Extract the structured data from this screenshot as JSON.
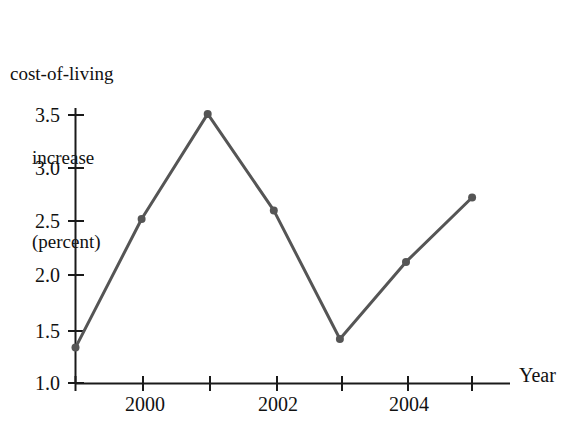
{
  "chart_data": {
    "type": "line",
    "title": "cost-of-living increase (percent)",
    "title_lines": [
      "cost-of-living",
      "increase",
      "(percent)"
    ],
    "xlabel": "Year",
    "ylabel": "cost-of-living increase (percent)",
    "x": [
      1999,
      2000,
      2001,
      2002,
      2003,
      2004,
      2005
    ],
    "values": [
      1.33,
      2.53,
      3.51,
      2.61,
      1.41,
      2.13,
      2.73
    ],
    "xlim": [
      1999,
      2005.6
    ],
    "ylim": [
      1.0,
      3.65
    ],
    "xticks": [
      1999,
      2000,
      2001,
      2002,
      2003,
      2004,
      2005
    ],
    "xtick_labels": [
      "",
      "2000",
      "",
      "2002",
      "",
      "2004",
      ""
    ],
    "yticks": [
      1.0,
      1.5,
      2.0,
      2.5,
      3.0,
      3.5
    ],
    "ytick_labels": [
      "1.0",
      "1.5",
      "2.0",
      "2.5",
      "3.0",
      "3.5"
    ],
    "grid": false,
    "legend": null,
    "marker": "circle",
    "line_color": "#555555",
    "axis_color": "#1a1a1a",
    "marker_color": "#555555"
  },
  "axis": {
    "y_labels": [
      {
        "text": "3.5",
        "top": 105
      },
      {
        "text": "3.0",
        "top": 158
      },
      {
        "text": "2.5",
        "top": 211
      },
      {
        "text": "2.0",
        "top": 265
      },
      {
        "text": "1.5",
        "top": 321
      },
      {
        "text": "1.0",
        "top": 373
      }
    ],
    "x_labels": [
      {
        "text": "2000",
        "left": 110
      },
      {
        "text": "2002",
        "left": 243
      },
      {
        "text": "2004",
        "left": 374
      }
    ],
    "x_axis_name": "Year"
  }
}
